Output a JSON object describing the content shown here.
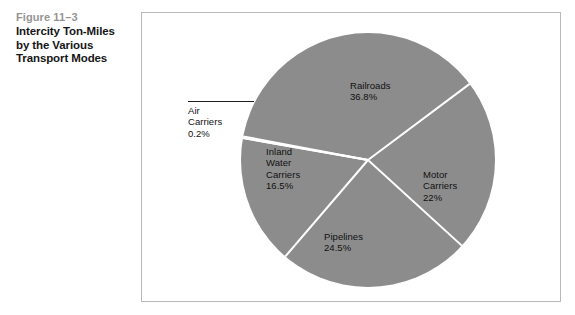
{
  "caption": {
    "figure_number": "Figure 11–3",
    "title_lines": [
      "Intercity Ton-Miles",
      "by the Various",
      "Transport  Modes"
    ],
    "number_color": "#949494",
    "title_color": "#161616"
  },
  "frame": {
    "border_color": "#b9b9b9",
    "background": "#ffffff"
  },
  "chart_data": {
    "type": "pie",
    "title": "Intercity Ton-Miles by the Various Transport Modes",
    "categories": [
      "Air Carriers",
      "Railroads",
      "Motor Carriers",
      "Pipelines",
      "Inland Water Carriers"
    ],
    "values": [
      0.2,
      36.8,
      22,
      24.5,
      16.5
    ],
    "value_labels": [
      "0.2%",
      "36.8%",
      "22%",
      "24.5%",
      "16.5%"
    ],
    "unit": "percent",
    "slice_color": "#8c8c8c",
    "separator_color": "#ffffff",
    "legend": "none",
    "grid": false,
    "start_angle_deg": -170,
    "direction": "clockwise",
    "center": [
      368,
      160
    ],
    "radius": 127
  },
  "labels": {
    "railroads": {
      "name": "Railroads",
      "pct": "36.8%"
    },
    "motor": {
      "name_line1": "Motor",
      "name_line2": "Carriers",
      "pct": "22%"
    },
    "pipelines": {
      "name": "Pipelines",
      "pct": "24.5%"
    },
    "inland": {
      "name_line1": "Inland",
      "name_line2": "Water",
      "name_line3": "Carriers",
      "pct": "16.5%"
    },
    "air": {
      "name_line1": "Air",
      "name_line2": "Carriers",
      "pct": "0.2%"
    }
  }
}
